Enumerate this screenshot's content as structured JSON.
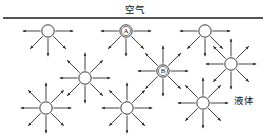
{
  "figure": {
    "title_air": "空气",
    "label_liquid": "液体",
    "surface_line": {
      "x1": 3,
      "x2": 263,
      "y": 18,
      "thickness": 1.6,
      "color": "#1a1a1a"
    },
    "colors": {
      "ink": "#1a1a1a",
      "background": "#ffffff",
      "arrow": "#222222",
      "circle_stroke": "#222222",
      "circle_fill": "#ffffff"
    },
    "geometry": {
      "width": 270,
      "height": 139,
      "circle_radius": 6.2,
      "arrow_length": 19,
      "arrow_head_size": 3.2
    },
    "particles": [
      {
        "id": "surface-molecule-left",
        "label": "",
        "cx": 48,
        "cy": 31,
        "row": "surface",
        "arrow_directions": [
          180,
          225,
          270,
          315,
          0
        ],
        "description": "surface molecule with no upward force arrows"
      },
      {
        "id": "surface-molecule-a",
        "label": "A",
        "cx": 126,
        "cy": 31,
        "row": "surface",
        "arrow_directions": [
          180,
          225,
          270,
          315,
          0
        ],
        "description": "labelled surface molecule A"
      },
      {
        "id": "surface-molecule-right",
        "label": "",
        "cx": 205,
        "cy": 31,
        "row": "surface",
        "arrow_directions": [
          180,
          225,
          270,
          315,
          0
        ],
        "description": "surface molecule with no upward force arrows"
      },
      {
        "id": "interior-molecule-upper-right",
        "label": "",
        "cx": 231,
        "cy": 64,
        "row": "interior-upper",
        "arrow_directions": [
          0,
          45,
          90,
          135,
          180,
          225,
          270,
          315
        ],
        "description": "interior molecule, balanced forces"
      },
      {
        "id": "interior-molecule-b",
        "label": "B",
        "cx": 163,
        "cy": 71,
        "row": "interior-upper",
        "arrow_directions": [
          0,
          45,
          90,
          135,
          180,
          225,
          270,
          315
        ],
        "description": "labelled interior molecule B, balanced forces"
      },
      {
        "id": "interior-molecule-mid-left",
        "label": "",
        "cx": 85,
        "cy": 78,
        "row": "interior-upper",
        "arrow_directions": [
          0,
          45,
          90,
          135,
          180,
          225,
          270,
          315
        ],
        "description": "interior molecule, balanced forces"
      },
      {
        "id": "interior-molecule-bottom-left",
        "label": "",
        "cx": 46,
        "cy": 108,
        "row": "interior-lower",
        "arrow_directions": [
          0,
          45,
          90,
          135,
          180,
          225,
          270,
          315
        ],
        "description": "interior molecule, balanced forces"
      },
      {
        "id": "interior-molecule-bottom-center",
        "label": "",
        "cx": 127,
        "cy": 108,
        "row": "interior-lower",
        "arrow_directions": [
          0,
          45,
          90,
          135,
          180,
          225,
          270,
          315
        ],
        "description": "interior molecule, balanced forces"
      },
      {
        "id": "interior-molecule-bottom-right",
        "label": "",
        "cx": 203,
        "cy": 103,
        "row": "interior-lower",
        "arrow_directions": [
          0,
          45,
          90,
          135,
          180,
          225,
          270,
          315
        ],
        "description": "interior molecule, balanced forces"
      }
    ],
    "air_label_pos": {
      "x": 135,
      "y": 13
    },
    "liquid_label_pos": {
      "x": 234,
      "y": 104
    }
  }
}
